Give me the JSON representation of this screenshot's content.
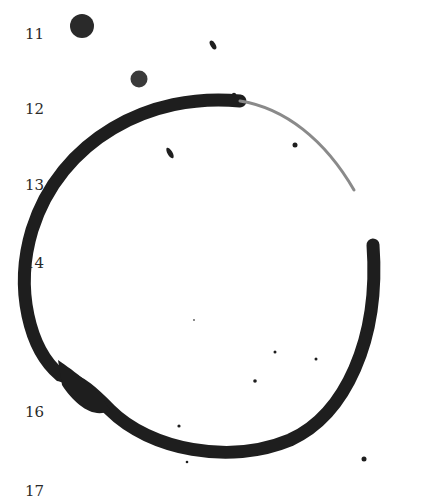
{
  "line_numbers": {
    "n11": "11",
    "n12": "12",
    "n13": "13",
    "n14": "14",
    "n16": "16",
    "n17": "17"
  },
  "colors": {
    "ink": "#1e1e1e",
    "faded_ink": "#8a8a8a",
    "background": "#ffffff"
  }
}
